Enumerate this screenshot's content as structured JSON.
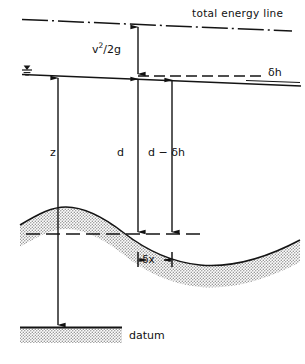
{
  "figure": {
    "title": "",
    "labels": {
      "total_energy_line": "total energy line",
      "velocity_head": "v",
      "velocity_head_exp": "2",
      "velocity_head_tail": "/2g",
      "delta_h": "δh",
      "depth_z": "z",
      "depth_d": "d",
      "depth_d_minus_dh": "d − δh",
      "delta_x": "δx",
      "datum": "datum"
    },
    "colors": {
      "ink": "#111111",
      "line": "#1a1a1a",
      "stipple_fill": "#cfcfcf",
      "background": "#ffffff"
    },
    "geometry": {
      "total_energy_line": {
        "x1": 22,
        "y1": 20,
        "x2": 292,
        "y2": 31,
        "style": "dash-dot"
      },
      "water_surface": {
        "x1": 22,
        "y1": 75,
        "x2": 300,
        "y2": 86,
        "style": "solid"
      },
      "delta_h_line": {
        "x1": 138,
        "y1": 76,
        "x2": 262,
        "y2": 76,
        "style": "dashed"
      },
      "bed_reference_line": {
        "x1": 26,
        "y1": 234,
        "x2": 200,
        "y2": 234,
        "style": "dashed"
      },
      "datum_line": {
        "x1": 20,
        "y1": 327,
        "x2": 122,
        "y2": 327,
        "style": "solid"
      },
      "arrow_velocity_head": {
        "x": 138,
        "y_top": 26,
        "y_bottom": 76,
        "heads": "both"
      },
      "arrow_z": {
        "x": 58,
        "y_top": 78,
        "y_bottom": 326,
        "heads": "both"
      },
      "arrow_d": {
        "x": 138,
        "y_top": 78,
        "y_bottom": 233,
        "heads": "both"
      },
      "arrow_d_minus_dh": {
        "x": 172,
        "y_top": 78,
        "y_bottom": 233,
        "heads": "both"
      },
      "arrow_delta_x": {
        "x_left": 138,
        "x_right": 172,
        "y": 260,
        "heads": "both"
      },
      "bed_crest_x": 62,
      "bed_trough_x": 222
    }
  }
}
